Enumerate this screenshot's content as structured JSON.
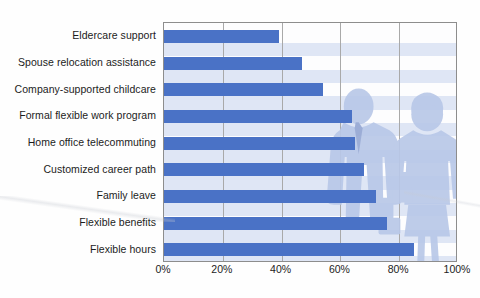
{
  "chart_data": {
    "type": "bar",
    "orientation": "horizontal",
    "title": "",
    "subtitle": "",
    "xlabel": "",
    "ylabel": "",
    "xlim": [
      0,
      100
    ],
    "xticks": [
      "0%",
      "20%",
      "40%",
      "60%",
      "80%",
      "100%"
    ],
    "xtick_values": [
      0,
      20,
      40,
      60,
      80,
      100
    ],
    "grid": "vertical",
    "legend": "none",
    "categories": [
      "Eldercare support",
      "Spouse relocation assistance",
      "Company-supported childcare",
      "Formal flexible work program",
      "Home office telecommuting",
      "Customized career path",
      "Family leave",
      "Flexible benefits",
      "Flexible hours"
    ],
    "values": [
      39,
      47,
      54,
      64,
      65,
      68,
      72,
      76,
      85
    ],
    "series": [
      {
        "name": "Percent of companies offering",
        "values": [
          39,
          47,
          54,
          64,
          65,
          68,
          72,
          76,
          85
        ]
      }
    ],
    "bar_color": "#4a72c6",
    "band_color": "#dfe6f5",
    "gridline_color": "#a9a9a9",
    "plot_border_color": "#8d8d8d",
    "silhouette_color": "#b9c8e8"
  },
  "axis": {
    "x_tick_labels": [
      "0%",
      "20%",
      "40%",
      "60%",
      "80%",
      "100%"
    ]
  },
  "decoration": {
    "silhouette_left_name": "businessman-silhouette",
    "silhouette_right_name": "businesswoman-silhouette"
  }
}
